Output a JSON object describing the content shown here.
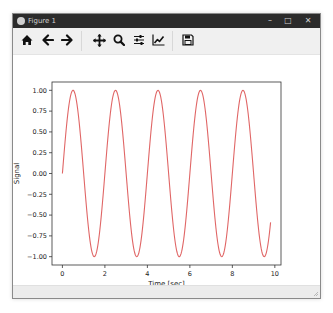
{
  "window": {
    "title": "Figure 1",
    "controls": {
      "minimize": "–",
      "maximize": "□",
      "close": "✕"
    }
  },
  "toolbar": {
    "buttons": [
      {
        "name": "home",
        "icon": "home-icon",
        "tooltip": "Reset original view"
      },
      {
        "name": "back",
        "icon": "arrow-left-icon",
        "tooltip": "Back to previous view"
      },
      {
        "name": "forward",
        "icon": "arrow-right-icon",
        "tooltip": "Forward to next view"
      },
      {
        "name": "pan",
        "icon": "move-icon",
        "tooltip": "Pan axes"
      },
      {
        "name": "zoom",
        "icon": "magnifier-icon",
        "tooltip": "Zoom to rectangle"
      },
      {
        "name": "subplots",
        "icon": "sliders-icon",
        "tooltip": "Configure subplots"
      },
      {
        "name": "edit",
        "icon": "line-chart-icon",
        "tooltip": "Edit axis"
      },
      {
        "name": "save",
        "icon": "floppy-disk-icon",
        "tooltip": "Save the figure"
      }
    ]
  },
  "colors": {
    "line": "#e06666",
    "titlebar": "#2b2b2b",
    "toolbar": "#f0f0f0",
    "axes": "#333333"
  },
  "chart_data": {
    "type": "line",
    "title": "",
    "xlabel": "Time [sec]",
    "ylabel": "Signal",
    "xlim": [
      -0.49,
      10.29
    ],
    "ylim": [
      -1.1,
      1.1
    ],
    "xticks": [
      0,
      2,
      4,
      6,
      8,
      10
    ],
    "xtick_labels": [
      "0",
      "2",
      "4",
      "6",
      "8",
      "10"
    ],
    "yticks": [
      1.0,
      0.75,
      0.5,
      0.25,
      0.0,
      -0.25,
      -0.5,
      -0.75,
      -1.0
    ],
    "ytick_labels": [
      "1.00",
      "0.75",
      "0.50",
      "0.25",
      "0.00",
      "−0.25",
      "−0.50",
      "−0.75",
      "−1.00"
    ],
    "grid": false,
    "legend": null,
    "series": [
      {
        "name": "signal",
        "function": "sin(2*pi*0.5*t)",
        "t_start": 0,
        "t_end": 9.8,
        "color": "#e06666",
        "x": [
          0,
          0.5,
          1.0,
          1.5,
          2.0,
          2.5,
          3.0,
          3.5,
          4.0,
          4.5,
          5.0,
          5.5,
          6.0,
          6.5,
          7.0,
          7.5,
          8.0,
          8.5,
          9.0,
          9.5,
          9.8
        ],
        "values": [
          0,
          1,
          0,
          -1,
          0,
          1,
          0,
          -1,
          0,
          1,
          0,
          -1,
          0,
          1,
          0,
          -1,
          0,
          1,
          0,
          -1,
          -0.31
        ]
      }
    ]
  }
}
